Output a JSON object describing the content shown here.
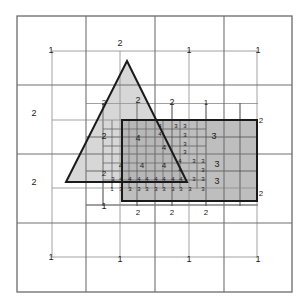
{
  "figure": {
    "kind": "adaptive-quadtree-mesh-refinement",
    "canvas": {
      "width": 307,
      "height": 308
    },
    "domain": {
      "x0": 17,
      "y0": 16,
      "x1": 292,
      "y1": 292
    },
    "colors": {
      "background": "#ffffff",
      "grid_line": "#8a8a8a",
      "fine_grid_line": "#6e6e6e",
      "outline": "#1a1a1a",
      "triangle_fill": "#cccccc",
      "rect_fill": "#b0b0b0",
      "overlap_fill": "#a8a8a8",
      "label": "#1a1a1a"
    }
  },
  "chart_data": {
    "type": "diagram",
    "title": "",
    "base_grid": {
      "rows": 4,
      "cols": 4,
      "level": 1
    },
    "shapes": [
      {
        "name": "triangle",
        "type": "polygon",
        "points": "127,61 187,182 66,182",
        "fill": "triangle_fill",
        "stroke": "outline",
        "stroke_width": 2
      },
      {
        "name": "rectangle",
        "type": "rect",
        "x": 122,
        "y": 120,
        "w": 135,
        "h": 81,
        "fill": "rect_fill",
        "stroke": "outline",
        "stroke_width": 2
      },
      {
        "name": "dashed-marker",
        "type": "polyline",
        "points": "122,174 122,120 187,120",
        "stroke": "outline",
        "stroke_width": 2,
        "dash": "6,4"
      }
    ],
    "grid_lines_level1": {
      "vertical_x": [
        86,
        155,
        224
      ],
      "horizontal_y": [
        85,
        154,
        223
      ]
    },
    "grid_lines_level2": {
      "vertical_x": [
        52,
        120,
        189,
        257
      ],
      "horizontal_y": [
        51,
        120,
        188,
        257
      ]
    },
    "grid_lines_level3": {
      "vertical_x": [
        103,
        137,
        172,
        206,
        240
      ],
      "horizontal_y": [
        103,
        137,
        171,
        205
      ]
    },
    "grid_lines_level4": {
      "vertical_x": [
        112,
        129,
        146,
        163,
        180,
        197
      ],
      "horizontal_y": [
        129,
        146,
        163,
        180
      ]
    },
    "refinement_levels": [
      {
        "level": 1,
        "label": "1",
        "meaning": "coarsest base cell"
      },
      {
        "level": 2,
        "label": "2",
        "meaning": "one subdivision"
      },
      {
        "level": 3,
        "label": "3",
        "meaning": "two subdivisions"
      },
      {
        "level": 4,
        "label": "4",
        "meaning": "finest, at shape boundary"
      }
    ],
    "labels": [
      {
        "text": "1",
        "x": 51,
        "y": 51,
        "size": 9,
        "level": 1
      },
      {
        "text": "2",
        "x": 120,
        "y": 44,
        "size": 9,
        "level": 2
      },
      {
        "text": "1",
        "x": 189,
        "y": 51,
        "size": 9,
        "level": 1
      },
      {
        "text": "1",
        "x": 258,
        "y": 51,
        "size": 9,
        "level": 1
      },
      {
        "text": "2",
        "x": 104,
        "y": 103,
        "size": 8,
        "level": 2
      },
      {
        "text": "2",
        "x": 138,
        "y": 101,
        "size": 9,
        "level": 2
      },
      {
        "text": "2",
        "x": 172,
        "y": 103,
        "size": 9,
        "level": 2
      },
      {
        "text": "1",
        "x": 206,
        "y": 103,
        "size": 8,
        "level": 1
      },
      {
        "text": "2",
        "x": 34,
        "y": 114,
        "size": 9,
        "level": 2
      },
      {
        "text": "2",
        "x": 104,
        "y": 137,
        "size": 9,
        "level": 2
      },
      {
        "text": "4",
        "x": 138,
        "y": 139,
        "size": 9,
        "level": 4
      },
      {
        "text": "4",
        "x": 160,
        "y": 126,
        "size": 6,
        "level": 4
      },
      {
        "text": "4",
        "x": 160,
        "y": 134,
        "size": 6,
        "level": 4
      },
      {
        "text": "3",
        "x": 176,
        "y": 126,
        "size": 6,
        "level": 3
      },
      {
        "text": "3",
        "x": 185,
        "y": 126,
        "size": 6,
        "level": 3
      },
      {
        "text": "3",
        "x": 185,
        "y": 135,
        "size": 6,
        "level": 3
      },
      {
        "text": "3",
        "x": 185,
        "y": 144,
        "size": 6,
        "level": 3
      },
      {
        "text": "3",
        "x": 185,
        "y": 152,
        "size": 6,
        "level": 3
      },
      {
        "text": "4",
        "x": 164,
        "y": 148,
        "size": 8,
        "level": 4
      },
      {
        "text": "3",
        "x": 214,
        "y": 137,
        "size": 9,
        "level": 3
      },
      {
        "text": "2",
        "x": 261,
        "y": 121,
        "size": 8,
        "level": 2
      },
      {
        "text": "2",
        "x": 34,
        "y": 183,
        "size": 9,
        "level": 2
      },
      {
        "text": "2",
        "x": 104,
        "y": 174,
        "size": 8,
        "level": 2
      },
      {
        "text": "4",
        "x": 121,
        "y": 166,
        "size": 8,
        "level": 4
      },
      {
        "text": "4",
        "x": 142,
        "y": 166,
        "size": 8,
        "level": 4
      },
      {
        "text": "4",
        "x": 164,
        "y": 166,
        "size": 8,
        "level": 4
      },
      {
        "text": "4",
        "x": 180,
        "y": 161,
        "size": 6,
        "level": 4
      },
      {
        "text": "4",
        "x": 180,
        "y": 170,
        "size": 6,
        "level": 4
      },
      {
        "text": "3",
        "x": 194,
        "y": 161,
        "size": 6,
        "level": 3
      },
      {
        "text": "3",
        "x": 203,
        "y": 161,
        "size": 6,
        "level": 3
      },
      {
        "text": "3",
        "x": 203,
        "y": 170,
        "size": 6,
        "level": 3
      },
      {
        "text": "3",
        "x": 217,
        "y": 165,
        "size": 9,
        "level": 3
      },
      {
        "text": "3",
        "x": 113,
        "y": 179,
        "size": 6,
        "level": 3
      },
      {
        "text": "4",
        "x": 121,
        "y": 179,
        "size": 6,
        "level": 4
      },
      {
        "text": "4",
        "x": 130,
        "y": 179,
        "size": 6,
        "level": 4
      },
      {
        "text": "4",
        "x": 139,
        "y": 179,
        "size": 6,
        "level": 4
      },
      {
        "text": "4",
        "x": 147,
        "y": 179,
        "size": 6,
        "level": 4
      },
      {
        "text": "4",
        "x": 156,
        "y": 179,
        "size": 6,
        "level": 4
      },
      {
        "text": "4",
        "x": 164,
        "y": 179,
        "size": 6,
        "level": 4
      },
      {
        "text": "4",
        "x": 173,
        "y": 179,
        "size": 6,
        "level": 4
      },
      {
        "text": "4",
        "x": 181,
        "y": 179,
        "size": 6,
        "level": 4
      },
      {
        "text": "3",
        "x": 194,
        "y": 179,
        "size": 6,
        "level": 3
      },
      {
        "text": "3",
        "x": 203,
        "y": 179,
        "size": 6,
        "level": 3
      },
      {
        "text": "3",
        "x": 217,
        "y": 182,
        "size": 9,
        "level": 3
      },
      {
        "text": "1",
        "x": 112,
        "y": 189,
        "size": 6,
        "level": 1
      },
      {
        "text": "3",
        "x": 121,
        "y": 189,
        "size": 6,
        "level": 3
      },
      {
        "text": "3",
        "x": 130,
        "y": 189,
        "size": 6,
        "level": 3
      },
      {
        "text": "3",
        "x": 139,
        "y": 189,
        "size": 6,
        "level": 3
      },
      {
        "text": "3",
        "x": 147,
        "y": 189,
        "size": 6,
        "level": 3
      },
      {
        "text": "3",
        "x": 156,
        "y": 189,
        "size": 6,
        "level": 3
      },
      {
        "text": "3",
        "x": 164,
        "y": 189,
        "size": 6,
        "level": 3
      },
      {
        "text": "3",
        "x": 173,
        "y": 189,
        "size": 6,
        "level": 3
      },
      {
        "text": "3",
        "x": 181,
        "y": 189,
        "size": 6,
        "level": 3
      },
      {
        "text": "3",
        "x": 190,
        "y": 189,
        "size": 6,
        "level": 3
      },
      {
        "text": "3",
        "x": 203,
        "y": 189,
        "size": 6,
        "level": 3
      },
      {
        "text": "2",
        "x": 261,
        "y": 194,
        "size": 8,
        "level": 2
      },
      {
        "text": "1",
        "x": 104,
        "y": 207,
        "size": 9,
        "level": 1
      },
      {
        "text": "2",
        "x": 138,
        "y": 213,
        "size": 8,
        "level": 2
      },
      {
        "text": "2",
        "x": 172,
        "y": 213,
        "size": 8,
        "level": 2
      },
      {
        "text": "2",
        "x": 206,
        "y": 213,
        "size": 8,
        "level": 2
      },
      {
        "text": "1",
        "x": 51,
        "y": 258,
        "size": 9,
        "level": 1
      },
      {
        "text": "1",
        "x": 120,
        "y": 260,
        "size": 9,
        "level": 1
      },
      {
        "text": "1",
        "x": 189,
        "y": 260,
        "size": 9,
        "level": 1
      },
      {
        "text": "1",
        "x": 258,
        "y": 260,
        "size": 9,
        "level": 1
      }
    ]
  }
}
